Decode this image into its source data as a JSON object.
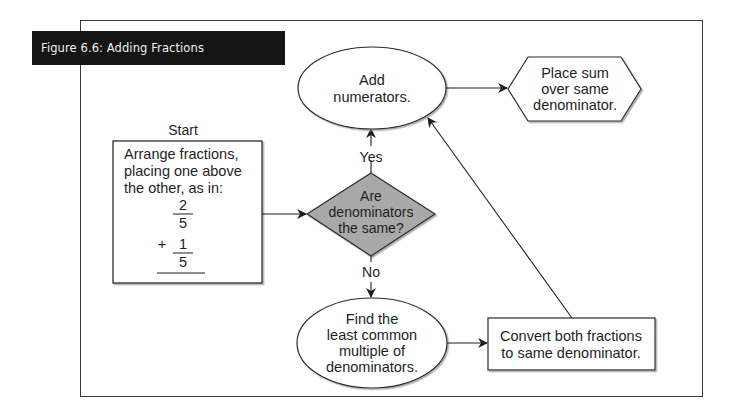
{
  "figure": {
    "title": "Figure 6.6: Adding Fractions"
  },
  "colors": {
    "stroke": "#2a2a2a",
    "decision_fill": "#a9a9a9",
    "banner_bg": "#151515",
    "banner_text": "#f2f2f2"
  },
  "nodes": {
    "start": {
      "label": "Start",
      "shape": "rectangle",
      "lines": [
        "Arrange fractions,",
        "placing one above",
        "the other, as in:"
      ],
      "example": {
        "first_numerator": "2",
        "first_denominator": "5",
        "operator": "+",
        "second_numerator": "1",
        "second_denominator": "5"
      }
    },
    "decision": {
      "shape": "diamond",
      "lines": [
        "Are",
        "denominators",
        "the same?"
      ]
    },
    "add_numerators": {
      "shape": "ellipse",
      "lines": [
        "Add",
        "numerators."
      ]
    },
    "place_sum": {
      "shape": "hexagon",
      "lines": [
        "Place sum",
        "over same",
        "denominator."
      ]
    },
    "find_lcm": {
      "shape": "ellipse",
      "lines": [
        "Find the",
        "least common",
        "multiple of",
        "denominators."
      ]
    },
    "convert": {
      "shape": "rectangle",
      "lines": [
        "Convert both fractions",
        "to same denominator."
      ]
    }
  },
  "edges": {
    "yes_label": "Yes",
    "no_label": "No",
    "list": [
      {
        "from": "start",
        "to": "decision"
      },
      {
        "from": "decision",
        "to": "add_numerators",
        "label": "Yes"
      },
      {
        "from": "decision",
        "to": "find_lcm",
        "label": "No"
      },
      {
        "from": "add_numerators",
        "to": "place_sum"
      },
      {
        "from": "find_lcm",
        "to": "convert"
      },
      {
        "from": "convert",
        "to": "add_numerators"
      }
    ]
  }
}
